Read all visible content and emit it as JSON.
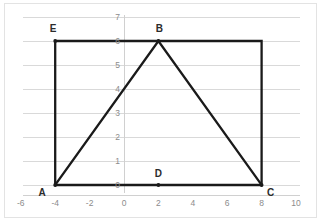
{
  "figure": {
    "background_color": "#ffffff",
    "frame_color": "#e3e3e3",
    "line_color": "#1a1a1a",
    "grid_color": "#d9d9d9",
    "tick_label_color": "#8c8c8c",
    "vertex_label_color": "#2b2b2b"
  },
  "chart_data": {
    "type": "scatter",
    "title": "",
    "xlabel": "",
    "ylabel": "",
    "xlim": [
      -6,
      10
    ],
    "ylim": [
      0,
      7
    ],
    "xticks": [
      -6,
      -4,
      -2,
      0,
      2,
      4,
      6,
      8,
      10
    ],
    "yticks": [
      0,
      1,
      2,
      3,
      4,
      5,
      6,
      7
    ],
    "xtick_labels": [
      "-6",
      "-4",
      "-2",
      "0",
      "2",
      "4",
      "6",
      "8",
      "10"
    ],
    "ytick_labels": [
      "0",
      "1",
      "2",
      "3",
      "4",
      "5",
      "6",
      "7"
    ],
    "grid": true,
    "grid_orientation": "horizontal",
    "legend": null,
    "points": [
      {
        "label": "A",
        "x": -4,
        "y": 0,
        "label_dx": -13,
        "label_dy": 11
      },
      {
        "label": "B",
        "x": 2,
        "y": 6,
        "label_dx": 1,
        "label_dy": -9
      },
      {
        "label": "C",
        "x": 8,
        "y": 0,
        "label_dx": 9,
        "label_dy": 11
      },
      {
        "label": "D",
        "x": 2,
        "y": 0,
        "label_dx": 0,
        "label_dy": -8
      },
      {
        "label": "E",
        "x": -4,
        "y": 6,
        "label_dx": -2,
        "label_dy": -9
      }
    ],
    "series": [
      {
        "name": "rectangle-AECD",
        "kind": "closed-polygon",
        "vertices": [
          [
            -4,
            0
          ],
          [
            -4,
            6
          ],
          [
            8,
            6
          ],
          [
            8,
            0
          ]
        ],
        "closed": true
      },
      {
        "name": "triangle-ABC",
        "kind": "polyline",
        "vertices": [
          [
            -4,
            0
          ],
          [
            2,
            6
          ],
          [
            8,
            0
          ]
        ],
        "closed": false
      }
    ],
    "annotations": [
      "Rectangle with corners A(-4,0), E(-4,6), (8,6), C(8,0)",
      "Triangle with vertices A(-4,0), B(2,6), C(8,0)",
      "Point D(2,0) on segment AC directly below apex B"
    ]
  }
}
